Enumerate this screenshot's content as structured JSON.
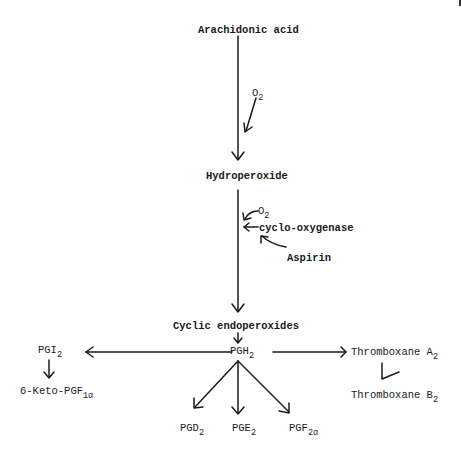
{
  "diagram": {
    "nodes": {
      "arachidonic_acid": "Arachidonic acid",
      "o2_first": {
        "base": "O",
        "sub": "2"
      },
      "hydroperoxide": "Hydroperoxide",
      "o2_second": {
        "base": "O",
        "sub": "2"
      },
      "cyclo_oxygenase": "cyclo-oxygenase",
      "aspirin": "Aspirin",
      "cyclic_endoperoxides": "Cyclic endoperoxides",
      "pgh2": {
        "base": "PGH",
        "sub": "2"
      },
      "pgi2": {
        "base": "PGI",
        "sub": "2"
      },
      "keto_pgf": {
        "base": "6-Keto-PGF",
        "sub": "1α"
      },
      "thromboxane_a2": {
        "base": "Thromboxane A",
        "sub": "2"
      },
      "thromboxane_b2": {
        "base": "Thromboxane B",
        "sub": "2"
      },
      "pgd2": {
        "base": "PGD",
        "sub": "2"
      },
      "pge2": {
        "base": "PGE",
        "sub": "2"
      },
      "pgf2a": {
        "base": "PGF",
        "sub": "2α"
      }
    },
    "edges": [
      {
        "from": "Arachidonic acid",
        "to": "Hydroperoxide",
        "cofactor": "O2"
      },
      {
        "from": "Hydroperoxide",
        "to": "Cyclic endoperoxides",
        "cofactor": "O2",
        "enzyme": "cyclo-oxygenase",
        "inhibitor": "Aspirin"
      },
      {
        "from": "Cyclic endoperoxides",
        "to": "PGH2"
      },
      {
        "from": "PGH2",
        "to": "PGI2"
      },
      {
        "from": "PGI2",
        "to": "6-Keto-PGF1α"
      },
      {
        "from": "PGH2",
        "to": "Thromboxane A2"
      },
      {
        "from": "Thromboxane A2",
        "to": "Thromboxane B2"
      },
      {
        "from": "PGH2",
        "to": "PGD2"
      },
      {
        "from": "PGH2",
        "to": "PGE2"
      },
      {
        "from": "PGH2",
        "to": "PGF2α"
      }
    ]
  }
}
